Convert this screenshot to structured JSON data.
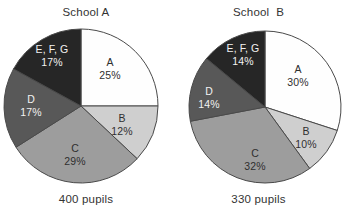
{
  "background_color": "#ffffff",
  "chart_data": [
    {
      "type": "pie",
      "title": "School A",
      "subtitle": "400 pupils",
      "total_label": "400 pupils",
      "total": 400,
      "xlabel": "",
      "ylabel": "",
      "legend": "none",
      "grid": false,
      "start_angle_deg": 0,
      "direction": "clockwise",
      "categories": [
        "A",
        "B",
        "C",
        "D",
        "E, F, G"
      ],
      "values": [
        25,
        12,
        29,
        17,
        17
      ],
      "value_labels": [
        "25%",
        "12%",
        "29%",
        "17%",
        "17%"
      ],
      "colors": [
        "#fefefe",
        "#cfcfcf",
        "#9d9d9d",
        "#585858",
        "#262626"
      ],
      "label_text_colors": [
        "#2f2f2f",
        "#2f2f2f",
        "#2f2f2f",
        "#f2f2f2",
        "#f2f2f2"
      ],
      "stroke_color": "#4a4a4a",
      "center": {
        "x": 81,
        "y": 106
      },
      "radius": 77,
      "slices": [
        {
          "name": "A",
          "percent_label": "25%",
          "value": 25,
          "color": "#fefefe",
          "text_color": "#2f2f2f",
          "label_x": 110,
          "label_y": 66
        },
        {
          "name": "B",
          "percent_label": "12%",
          "value": 12,
          "color": "#cfcfcf",
          "text_color": "#2f2f2f",
          "label_x": 122,
          "label_y": 122
        },
        {
          "name": "C",
          "percent_label": "29%",
          "value": 29,
          "color": "#9d9d9d",
          "text_color": "#2f2f2f",
          "label_x": 75,
          "label_y": 152
        },
        {
          "name": "D",
          "percent_label": "17%",
          "value": 17,
          "color": "#585858",
          "text_color": "#f2f2f2",
          "label_x": 31,
          "label_y": 103
        },
        {
          "name": "E, F, G",
          "percent_label": "17%",
          "value": 17,
          "color": "#262626",
          "text_color": "#f2f2f2",
          "label_x": 52,
          "label_y": 53
        }
      ]
    },
    {
      "type": "pie",
      "title": "School  B",
      "subtitle": "330 pupils",
      "total_label": "330 pupils",
      "total": 330,
      "xlabel": "",
      "ylabel": "",
      "legend": "none",
      "grid": false,
      "start_angle_deg": 0,
      "direction": "clockwise",
      "categories": [
        "A",
        "B",
        "C",
        "D",
        "E, F, G"
      ],
      "values": [
        30,
        10,
        32,
        14,
        14
      ],
      "value_labels": [
        "30%",
        "10%",
        "32%",
        "14%",
        "14%"
      ],
      "colors": [
        "#fefefe",
        "#cfcfcf",
        "#9d9d9d",
        "#585858",
        "#262626"
      ],
      "label_text_colors": [
        "#2f2f2f",
        "#2f2f2f",
        "#2f2f2f",
        "#f2f2f2",
        "#f2f2f2"
      ],
      "stroke_color": "#4a4a4a",
      "center": {
        "x": 93,
        "y": 107
      },
      "radius": 76,
      "slices": [
        {
          "name": "A",
          "percent_label": "30%",
          "value": 30,
          "color": "#fefefe",
          "text_color": "#2f2f2f",
          "label_x": 126,
          "label_y": 73
        },
        {
          "name": "B",
          "percent_label": "10%",
          "value": 10,
          "color": "#cfcfcf",
          "text_color": "#2f2f2f",
          "label_x": 134,
          "label_y": 135
        },
        {
          "name": "C",
          "percent_label": "32%",
          "value": 32,
          "color": "#9d9d9d",
          "text_color": "#2f2f2f",
          "label_x": 83,
          "label_y": 157
        },
        {
          "name": "D",
          "percent_label": "14%",
          "value": 14,
          "color": "#585858",
          "text_color": "#f2f2f2",
          "label_x": 37,
          "label_y": 95
        },
        {
          "name": "E, F, G",
          "percent_label": "14%",
          "value": 14,
          "color": "#262626",
          "text_color": "#f2f2f2",
          "label_x": 71,
          "label_y": 52
        }
      ]
    }
  ]
}
